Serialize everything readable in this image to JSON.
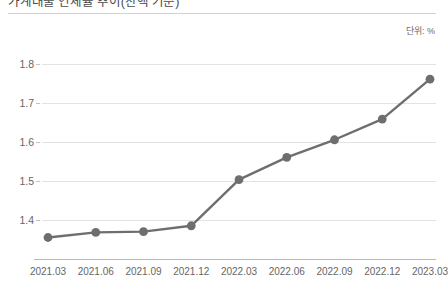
{
  "header": {
    "title": "가계대출 연체율 추이(잔액 기준)",
    "unit_label": "단위: %"
  },
  "chart_data": {
    "type": "line",
    "title": "가계대출 연체율 추이(잔액 기준)",
    "xlabel": "",
    "ylabel": "",
    "unit": "%",
    "grid": true,
    "legend": "none",
    "ylim": [
      1.3,
      1.85
    ],
    "yticks": [
      1.4,
      1.5,
      1.6,
      1.7,
      1.8
    ],
    "ytick_labels": [
      "1.4",
      "1.5",
      "1.6",
      "1.7",
      "1.8"
    ],
    "categories": [
      "2021.03",
      "2021.06",
      "2021.09",
      "2021.12",
      "2022.03",
      "2022.06",
      "2022.09",
      "2022.12",
      "2023.03"
    ],
    "values": [
      1.355,
      1.368,
      1.37,
      1.385,
      1.503,
      1.56,
      1.605,
      1.658,
      1.76
    ],
    "series": [
      {
        "name": "가계대출 연체율",
        "values": [
          1.355,
          1.368,
          1.37,
          1.385,
          1.503,
          1.56,
          1.605,
          1.658,
          1.76
        ],
        "color": "#6e6e6e",
        "marker": "circle"
      }
    ],
    "colors": {
      "line": "#6e6e6e",
      "marker": "#6e6e6e",
      "gridline": "#e3e3e3",
      "axis": "#b9b9b9",
      "text": "#666666"
    }
  }
}
